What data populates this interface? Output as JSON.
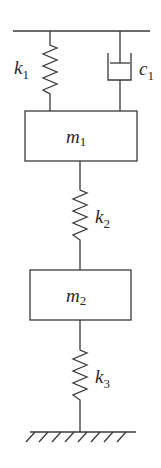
{
  "diagram": {
    "colors": {
      "line": "#3a3a3a",
      "text": "#2a2a2a",
      "background": "#ffffff"
    },
    "support": {
      "type": "fixed-ceiling"
    },
    "ground": {
      "type": "fixed-ground-hatched"
    },
    "elements": {
      "k1": {
        "symbol": "k",
        "sub": "1",
        "type": "spring",
        "connects": [
          "ceiling",
          "m1"
        ]
      },
      "c1": {
        "symbol": "c",
        "sub": "1",
        "type": "damper",
        "connects": [
          "ceiling",
          "m1"
        ]
      },
      "m1": {
        "symbol": "m",
        "sub": "1",
        "type": "mass"
      },
      "k2": {
        "symbol": "k",
        "sub": "2",
        "type": "spring",
        "connects": [
          "m1",
          "m2"
        ]
      },
      "m2": {
        "symbol": "m",
        "sub": "2",
        "type": "mass"
      },
      "k3": {
        "symbol": "k",
        "sub": "3",
        "type": "spring",
        "connects": [
          "m2",
          "ground"
        ]
      }
    }
  }
}
